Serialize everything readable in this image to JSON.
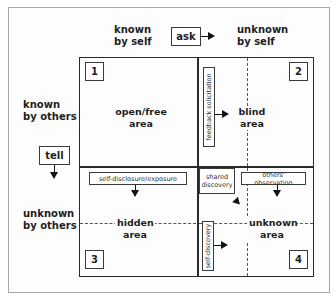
{
  "diagram": {
    "column_headers": {
      "known_by_self": "known\nby self",
      "unknown_by_self": "unknown\nby self"
    },
    "row_headers": {
      "known_by_others": "known\nby others",
      "unknown_by_others": "unknown\nby others"
    },
    "actions": {
      "ask": "ask",
      "tell": "tell"
    },
    "quadrants": [
      {
        "number": "1",
        "label_line1": "open/free",
        "label_line2": "area"
      },
      {
        "number": "2",
        "label_line1": "blind",
        "label_line2": "area"
      },
      {
        "number": "3",
        "label_line1": "hidden",
        "label_line2": "area"
      },
      {
        "number": "4",
        "label_line1": "unknown",
        "label_line2": "area"
      }
    ],
    "processes": {
      "feedback_solicitation": "feedback solicitation",
      "self_disclosure": "self-disclosure/exposure",
      "shared_discovery_line1": "shared",
      "shared_discovery_line2": "discovery",
      "others_observation": "others' observation",
      "self_discovery": "self-discovery"
    }
  }
}
